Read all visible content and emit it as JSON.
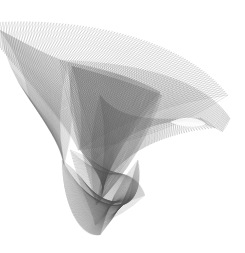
{
  "artwork": {
    "title": "",
    "description": "Abstract string-art ribbon surface rendered in thin grey lines",
    "background": "#ffffff",
    "stroke_color": "#555555",
    "width": 245,
    "height": 253
  },
  "ribbons": [
    {
      "name": "outer-top-sweep",
      "lines": 90,
      "opacity": 0.35,
      "width": 0.45,
      "curveA": [
        [
          0,
          22
        ],
        [
          90,
          18
        ],
        [
          185,
          40
        ],
        [
          228,
          95
        ]
      ],
      "curveB": [
        [
          0,
          48
        ],
        [
          40,
          95
        ],
        [
          70,
          130
        ],
        [
          78,
          150
        ]
      ]
    },
    {
      "name": "outer-right-lobe",
      "lines": 110,
      "opacity": 0.33,
      "width": 0.45,
      "curveA": [
        [
          60,
          60
        ],
        [
          140,
          62
        ],
        [
          205,
          80
        ],
        [
          230,
          118
        ]
      ],
      "curveB": [
        [
          95,
          160
        ],
        [
          140,
          120
        ],
        [
          190,
          112
        ],
        [
          222,
          132
        ]
      ]
    },
    {
      "name": "inner-triangle-left",
      "lines": 95,
      "opacity": 0.42,
      "width": 0.45,
      "curveA": [
        [
          68,
          62
        ],
        [
          70,
          100
        ],
        [
          80,
          150
        ],
        [
          95,
          200
        ]
      ],
      "curveB": [
        [
          68,
          62
        ],
        [
          110,
          70
        ],
        [
          140,
          80
        ],
        [
          160,
          92
        ]
      ]
    },
    {
      "name": "inner-triangle-fill",
      "lines": 90,
      "opacity": 0.4,
      "width": 0.45,
      "curveA": [
        [
          72,
          66
        ],
        [
          95,
          72
        ],
        [
          130,
          82
        ],
        [
          162,
          95
        ]
      ],
      "curveB": [
        [
          80,
          150
        ],
        [
          100,
          175
        ],
        [
          110,
          190
        ],
        [
          96,
          205
        ]
      ]
    },
    {
      "name": "center-fold",
      "lines": 80,
      "opacity": 0.38,
      "width": 0.45,
      "curveA": [
        [
          100,
          95
        ],
        [
          120,
          120
        ],
        [
          150,
          120
        ],
        [
          200,
          118
        ]
      ],
      "curveB": [
        [
          96,
          205
        ],
        [
          110,
          160
        ],
        [
          150,
          135
        ],
        [
          215,
          128
        ]
      ]
    },
    {
      "name": "bottom-loop",
      "lines": 110,
      "opacity": 0.38,
      "width": 0.45,
      "curveA": [
        [
          62,
          160
        ],
        [
          62,
          205
        ],
        [
          80,
          238
        ],
        [
          100,
          235
        ]
      ],
      "curveB": [
        [
          96,
          200
        ],
        [
          125,
          215
        ],
        [
          145,
          200
        ],
        [
          138,
          160
        ]
      ]
    },
    {
      "name": "bottom-loop-inner",
      "lines": 70,
      "opacity": 0.32,
      "width": 0.45,
      "curveA": [
        [
          70,
          150
        ],
        [
          80,
          190
        ],
        [
          92,
          210
        ],
        [
          95,
          225
        ]
      ],
      "curveB": [
        [
          110,
          175
        ],
        [
          125,
          170
        ],
        [
          140,
          180
        ],
        [
          145,
          195
        ]
      ]
    },
    {
      "name": "left-vertical-strands",
      "lines": 60,
      "opacity": 0.3,
      "width": 0.45,
      "curveA": [
        [
          0,
          30
        ],
        [
          20,
          40
        ],
        [
          45,
          55
        ],
        [
          68,
          62
        ]
      ],
      "curveB": [
        [
          30,
          100
        ],
        [
          50,
          130
        ],
        [
          60,
          145
        ],
        [
          64,
          165
        ]
      ]
    }
  ],
  "highlights": [
    {
      "name": "lens-gap",
      "path": "M170,122 C182,116 198,116 206,124 C198,128 184,128 170,122 Z",
      "fill": "#ffffff",
      "opacity": 0.85
    }
  ]
}
